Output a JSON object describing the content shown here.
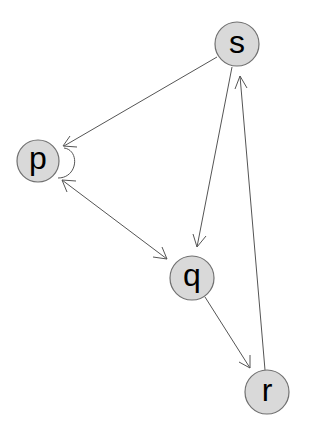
{
  "diagram": {
    "type": "directed-graph",
    "nodes": [
      {
        "id": "s",
        "label": "s",
        "cx": 237,
        "cy": 44,
        "r": 22
      },
      {
        "id": "p",
        "label": "p",
        "cx": 38,
        "cy": 161,
        "r": 21
      },
      {
        "id": "q",
        "label": "q",
        "cx": 192,
        "cy": 278,
        "r": 22
      },
      {
        "id": "r",
        "label": "r",
        "cx": 267,
        "cy": 392,
        "r": 22
      }
    ],
    "edges": [
      {
        "from": "s",
        "to": "p"
      },
      {
        "from": "p",
        "to": "q"
      },
      {
        "from": "q",
        "to": "p"
      },
      {
        "from": "s",
        "to": "q"
      },
      {
        "from": "q",
        "to": "r"
      },
      {
        "from": "r",
        "to": "s"
      },
      {
        "from": "p",
        "to": "p"
      }
    ],
    "style": {
      "node_fill": "#d9d9d9",
      "node_stroke": "#707070",
      "edge_color": "#555555",
      "background": "#ffffff"
    }
  }
}
